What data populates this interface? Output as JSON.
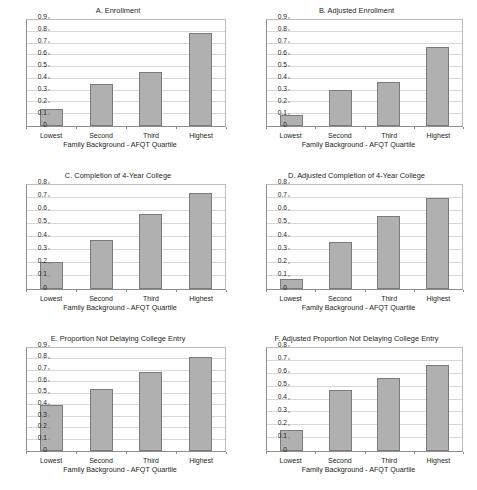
{
  "figure": {
    "columns": 2,
    "rows": 3,
    "background": "#ffffff",
    "bar_fill": "#b0b0b0",
    "bar_stroke": "#7b7b7b",
    "gridline_color": "#d7d7d7",
    "axis_color": "#8d8d8d",
    "text_color": "#231f20"
  },
  "chart_data": [
    {
      "type": "bar",
      "panel": "A",
      "title": "A. Enrollment",
      "categories": [
        "Lowest",
        "Second",
        "Third",
        "Highest"
      ],
      "values": [
        0.145,
        0.36,
        0.46,
        0.79
      ],
      "xlabel": "Family Background - AFQT Quartile",
      "ylabel": "",
      "ylim": [
        0,
        0.9
      ],
      "yticks": [
        0,
        0.1,
        0.2,
        0.3,
        0.4,
        0.5,
        0.6,
        0.7,
        0.8,
        0.9
      ],
      "ytick_labels": [
        "0",
        "0.1",
        "0.2",
        "0.3",
        "0.4",
        "0.5",
        "0.6",
        "0.7",
        "0.8",
        "0.9"
      ],
      "grid": true,
      "legend": null
    },
    {
      "type": "bar",
      "panel": "B",
      "title": "B. Adjusted Enrollment",
      "categories": [
        "Lowest",
        "Second",
        "Third",
        "Highest"
      ],
      "values": [
        0.09,
        0.305,
        0.375,
        0.67
      ],
      "xlabel": "Family Background - AFQT Quartile",
      "ylabel": "",
      "ylim": [
        0,
        0.9
      ],
      "yticks": [
        0,
        0.1,
        0.2,
        0.3,
        0.4,
        0.5,
        0.6,
        0.7,
        0.8,
        0.9
      ],
      "ytick_labels": [
        "0",
        "0.1",
        "0.2",
        "0.3",
        "0.4",
        "0.5",
        "0.6",
        "0.7",
        "0.8",
        "0.9"
      ],
      "grid": true,
      "legend": null
    },
    {
      "type": "bar",
      "panel": "C",
      "title": "C. Completion of 4-Year College",
      "categories": [
        "Lowest",
        "Second",
        "Third",
        "Highest"
      ],
      "values": [
        0.205,
        0.38,
        0.58,
        0.74
      ],
      "xlabel": "Family Background - AFQT Quartile",
      "ylabel": "",
      "ylim": [
        0,
        0.8
      ],
      "yticks": [
        0,
        0.1,
        0.2,
        0.3,
        0.4,
        0.5,
        0.6,
        0.7,
        0.8
      ],
      "ytick_labels": [
        "0",
        "0.1",
        "0.2",
        "0.3",
        "0.4",
        "0.5",
        "0.6",
        "0.7",
        "0.8"
      ],
      "grid": true,
      "legend": null
    },
    {
      "type": "bar",
      "panel": "D",
      "title": "D. Adjusted Completion of 4-Year College",
      "categories": [
        "Lowest",
        "Second",
        "Third",
        "Highest"
      ],
      "values": [
        0.08,
        0.36,
        0.565,
        0.7
      ],
      "xlabel": "Family Background - AFQT Quartile",
      "ylabel": "",
      "ylim": [
        0,
        0.8
      ],
      "yticks": [
        0,
        0.1,
        0.2,
        0.3,
        0.4,
        0.5,
        0.6,
        0.7,
        0.8
      ],
      "ytick_labels": [
        "0",
        "0.1",
        "0.2",
        "0.3",
        "0.4",
        "0.5",
        "0.6",
        "0.7",
        "0.8"
      ],
      "grid": true,
      "legend": null
    },
    {
      "type": "bar",
      "panel": "E",
      "title": "E. Proportion Not Delaying College Entry",
      "categories": [
        "Lowest",
        "Second",
        "Third",
        "Highest"
      ],
      "values": [
        0.4,
        0.54,
        0.69,
        0.825
      ],
      "xlabel": "Family Background - AFQT Quartile",
      "ylabel": "",
      "ylim": [
        0,
        0.9
      ],
      "yticks": [
        0,
        0.1,
        0.2,
        0.3,
        0.4,
        0.5,
        0.6,
        0.7,
        0.8,
        0.9
      ],
      "ytick_labels": [
        "0",
        "0.1",
        "0.2",
        "0.3",
        "0.4",
        "0.5",
        "0.6",
        "0.7",
        "0.8",
        "0.9"
      ],
      "grid": true,
      "legend": null
    },
    {
      "type": "bar",
      "panel": "F",
      "title": "F. Adjusted Proportion Not Delaying College Entry",
      "categories": [
        "Lowest",
        "Second",
        "Third",
        "Highest"
      ],
      "values": [
        0.165,
        0.475,
        0.565,
        0.665
      ],
      "xlabel": "Family Background - AFQT Quartile",
      "ylabel": "",
      "ylim": [
        0,
        0.8
      ],
      "yticks": [
        0,
        0.1,
        0.2,
        0.3,
        0.4,
        0.5,
        0.6,
        0.7,
        0.8
      ],
      "ytick_labels": [
        "0",
        "0.1",
        "0.2",
        "0.3",
        "0.4",
        "0.5",
        "0.6",
        "0.7",
        "0.8"
      ],
      "grid": true,
      "legend": null
    }
  ]
}
